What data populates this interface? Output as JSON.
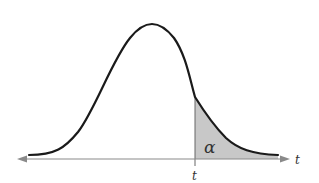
{
  "diagram": {
    "title": "",
    "type": "t-distribution right-tail area",
    "labels": {
      "critical_value": "t",
      "axis_label": "t",
      "area_label": "α"
    },
    "colors": {
      "curve": "#1a1a1a",
      "axis": "#8a8a8a",
      "shaded_area": "#c8c8c8",
      "background": "#ffffff"
    },
    "shaded_region": "right tail beyond t"
  }
}
